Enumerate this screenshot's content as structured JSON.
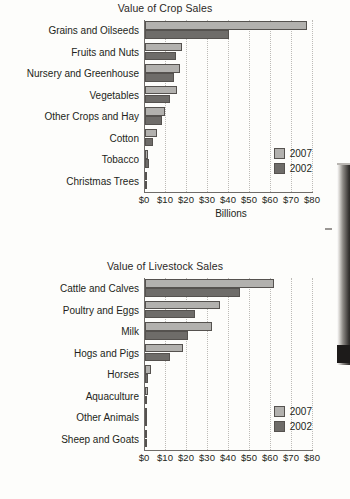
{
  "document": {
    "artifact": "book-spine-scan-edge"
  },
  "legend": {
    "position": "bottom-right",
    "entries": [
      {
        "label": "2007",
        "color": "#b2b1ae"
      },
      {
        "label": "2002",
        "color": "#6e6c69"
      }
    ]
  },
  "axis": {
    "ticks": [
      "$0",
      "$10",
      "$20",
      "$30",
      "$40",
      "$50",
      "$60",
      "$70",
      "$80"
    ],
    "caption": "Billions"
  },
  "chart_data": [
    {
      "type": "bar",
      "orientation": "horizontal",
      "title": "Value of Crop Sales",
      "xlabel": "Billions",
      "ylabel": "",
      "xlim": [
        0,
        80
      ],
      "xticks": [
        0,
        10,
        20,
        30,
        40,
        50,
        60,
        70,
        80
      ],
      "xtick_labels": [
        "$0",
        "$10",
        "$20",
        "$30",
        "$40",
        "$50",
        "$60",
        "$70",
        "$80"
      ],
      "grid": true,
      "legend": [
        "2007",
        "2002"
      ],
      "legend_position": "bottom-right",
      "categories": [
        "Grains and Oilseeds",
        "Fruits and Nuts",
        "Nursery and Greenhouse",
        "Vegetables",
        "Other Crops and Hay",
        "Cotton",
        "Tobacco",
        "Christmas Trees"
      ],
      "series": [
        {
          "name": "2007",
          "color": "#b2b1ae",
          "values": [
            77.0,
            17.5,
            16.6,
            15.1,
            9.3,
            5.5,
            1.4,
            0.3
          ]
        },
        {
          "name": "2002",
          "color": "#6e6c69",
          "values": [
            40.0,
            14.6,
            14.0,
            11.7,
            8.0,
            3.8,
            2.0,
            0.3
          ]
        }
      ]
    },
    {
      "type": "bar",
      "orientation": "horizontal",
      "title": "Value of Livestock Sales",
      "xlabel": "",
      "ylabel": "",
      "xlim": [
        0,
        80
      ],
      "xticks": [
        0,
        10,
        20,
        30,
        40,
        50,
        60,
        70,
        80
      ],
      "xtick_labels": [
        "$0",
        "$10",
        "$20",
        "$30",
        "$40",
        "$50",
        "$60",
        "$70",
        "$80"
      ],
      "grid": true,
      "legend": [
        "2007",
        "2002"
      ],
      "legend_position": "bottom-right",
      "categories": [
        "Cattle and Calves",
        "Poultry and Eggs",
        "Milk",
        "Hogs and Pigs",
        "Horses",
        "Aquaculture",
        "Other Animals",
        "Sheep and Goats"
      ],
      "series": [
        {
          "name": "2007",
          "color": "#b2b1ae",
          "values": [
            61.2,
            35.7,
            31.8,
            18.2,
            2.8,
            1.4,
            0.7,
            0.5
          ]
        },
        {
          "name": "2002",
          "color": "#6e6c69",
          "values": [
            45.1,
            23.9,
            20.3,
            12.1,
            1.5,
            0.9,
            0.5,
            0.4
          ]
        }
      ]
    }
  ]
}
